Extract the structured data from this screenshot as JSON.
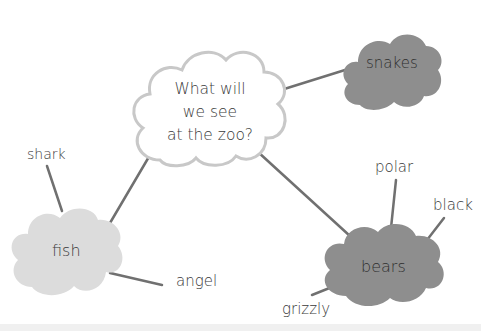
{
  "diagram": {
    "type": "mind-map",
    "central": {
      "id": "center",
      "lines": [
        "What will",
        "we see",
        "at the zoo?"
      ],
      "fill": "#ffffff",
      "stroke": "#c8c8c8"
    },
    "categories": [
      {
        "id": "snakes",
        "label": "snakes",
        "fill": "#8e8e8e",
        "children": []
      },
      {
        "id": "fish",
        "label": "fish",
        "fill": "#dcdcdc",
        "children": [
          "shark",
          "angel"
        ]
      },
      {
        "id": "bears",
        "label": "bears",
        "fill": "#8e8e8e",
        "children": [
          "polar",
          "black",
          "grizzly"
        ]
      }
    ],
    "leaves": {
      "shark": "shark",
      "angel": "angel",
      "polar": "polar",
      "black": "black",
      "grizzly": "grizzly"
    },
    "connector_color": "#6e6e6e"
  }
}
